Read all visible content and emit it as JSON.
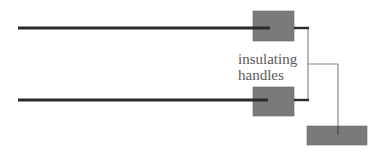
{
  "diagram": {
    "label": {
      "line1": "insulating",
      "line2": "handles"
    },
    "colors": {
      "rod": "#2b2b2b",
      "handle_fill": "#7a7a7a",
      "handle_stroke": "#6a6a6a",
      "wire": "#8a8a8a",
      "text": "#5a5a5a"
    },
    "elements": [
      {
        "name": "top-rod",
        "type": "thick-line"
      },
      {
        "name": "bottom-rod",
        "type": "thick-line"
      },
      {
        "name": "top-insulating-handle",
        "type": "box"
      },
      {
        "name": "bottom-insulating-handle",
        "type": "box"
      },
      {
        "name": "connecting-wire",
        "type": "thin-line"
      },
      {
        "name": "ground-block",
        "type": "box"
      }
    ]
  }
}
